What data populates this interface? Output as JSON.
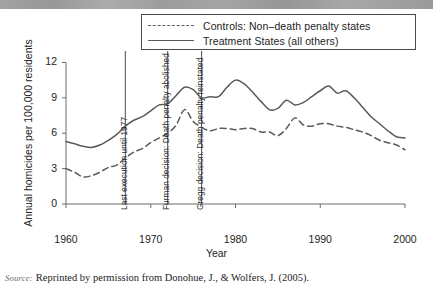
{
  "figure": {
    "xlabel": "Year",
    "ylabel": "Annual homicides per 100,000 residents",
    "source_kicker": "Source:",
    "source_text": "Reprinted by permission from Donohue, J., & Wolfers, J. (2005)."
  },
  "legend": {
    "items": [
      {
        "label": "Controls: Non–death penalty states",
        "style": "dashed"
      },
      {
        "label": "Treatment States (all others)",
        "style": "solid"
      }
    ]
  },
  "chart_data": {
    "type": "line",
    "title": "",
    "xlabel": "Year",
    "ylabel": "Annual homicides per 100,000 residents",
    "xlim": [
      1960,
      2000
    ],
    "ylim": [
      0,
      12.8
    ],
    "xticks": [
      1960,
      1970,
      1980,
      1990,
      2000
    ],
    "yticks": [
      0,
      3,
      6,
      9,
      12
    ],
    "grid": false,
    "legend_position": "top",
    "line_color": "#5a5a5a",
    "x": [
      1960,
      1961,
      1962,
      1963,
      1964,
      1965,
      1966,
      1967,
      1968,
      1969,
      1970,
      1971,
      1972,
      1973,
      1974,
      1975,
      1976,
      1977,
      1978,
      1979,
      1980,
      1981,
      1982,
      1983,
      1984,
      1985,
      1986,
      1987,
      1988,
      1989,
      1990,
      1991,
      1992,
      1993,
      1994,
      1995,
      1996,
      1997,
      1998,
      1999,
      2000
    ],
    "series": [
      {
        "name": "Treatment States (all others)",
        "style": "solid",
        "values": [
          5.3,
          5.1,
          4.9,
          4.8,
          5.0,
          5.4,
          5.9,
          6.6,
          7.1,
          7.4,
          7.9,
          8.4,
          8.5,
          9.2,
          9.9,
          9.7,
          9.0,
          9.1,
          9.1,
          9.9,
          10.5,
          10.2,
          9.5,
          8.7,
          8.0,
          8.1,
          8.8,
          8.4,
          8.6,
          9.1,
          9.6,
          10.0,
          9.4,
          9.6,
          9.0,
          8.2,
          7.4,
          6.8,
          6.2,
          5.7,
          5.6
        ]
      },
      {
        "name": "Controls: Non–death penalty states",
        "style": "dashed",
        "values": [
          3.0,
          2.7,
          2.3,
          2.4,
          2.7,
          3.1,
          3.3,
          3.9,
          4.4,
          4.7,
          5.2,
          5.6,
          6.0,
          6.7,
          8.0,
          7.0,
          6.5,
          6.2,
          6.4,
          6.4,
          6.3,
          6.4,
          6.4,
          6.1,
          6.1,
          5.8,
          6.4,
          7.3,
          6.7,
          6.6,
          6.8,
          6.8,
          6.6,
          6.5,
          6.3,
          6.1,
          5.8,
          5.4,
          5.2,
          5.0,
          4.6
        ]
      }
    ],
    "annotations": [
      {
        "x": 1967,
        "label": "Last execution until 1977"
      },
      {
        "x": 1972,
        "label": "Furman decision: Death penalty abolished"
      },
      {
        "x": 1976,
        "label": "Gregg decision: Death penalty reinstated"
      }
    ]
  }
}
